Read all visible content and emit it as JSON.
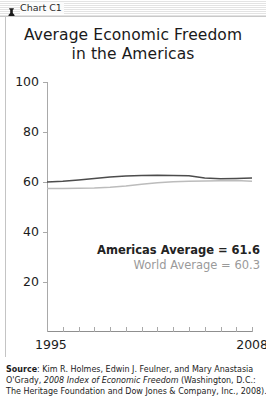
{
  "window": {
    "titlebar_label": "Chart C1",
    "titlebar_icon": "bell-icon"
  },
  "chart_data": {
    "type": "line",
    "title_line1": "Average Economic Freedom",
    "title_line2": "in the Americas",
    "xlabel": "",
    "ylabel": "",
    "ylim": [
      0,
      100
    ],
    "yticks": [
      100,
      80,
      60,
      40,
      20
    ],
    "xlim": [
      1995,
      2008
    ],
    "xtick_labels": [
      "1995",
      "2008"
    ],
    "x": [
      1995,
      1996,
      1997,
      1998,
      1999,
      2000,
      2001,
      2002,
      2003,
      2004,
      2005,
      2006,
      2007,
      2008
    ],
    "grid": false,
    "legend_position": "inline-annotation",
    "series": [
      {
        "name": "Americas Average",
        "color": "#4c4c4c",
        "values": [
          60.0,
          60.3,
          60.8,
          61.4,
          62.0,
          62.4,
          62.6,
          62.7,
          62.6,
          62.5,
          61.6,
          61.3,
          61.4,
          61.6
        ]
      },
      {
        "name": "World Average",
        "color": "#bcbcbc",
        "values": [
          57.4,
          57.4,
          57.5,
          57.6,
          57.9,
          58.4,
          59.1,
          59.7,
          60.1,
          60.3,
          60.4,
          60.5,
          60.6,
          60.3
        ]
      }
    ],
    "annotations": [
      {
        "label": "Americas Average = 61.6",
        "color": "#232323",
        "bold": true
      },
      {
        "label": "World Average = 60.3",
        "color": "#9a9a9a",
        "bold": false
      }
    ]
  },
  "source": {
    "prefix": "Source",
    "line1_rest": ": Kim R. Holmes, Edwin J. Feulner, and Mary Anastasia",
    "line2_a": "O'Grady, ",
    "line2_italic": "2008 Index of Economic Freedom",
    "line2_b": " (Washington, D.C.:",
    "line3": "The Heritage Foundation and Dow Jones & Company, Inc., 2008)."
  }
}
